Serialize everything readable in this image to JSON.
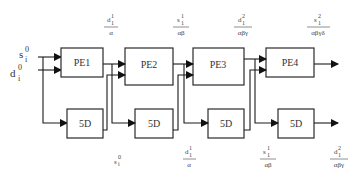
{
  "diagram": {
    "inputs": [
      {
        "base": "s",
        "sub": "i",
        "sup": "0"
      },
      {
        "base": "d",
        "sub": "i",
        "sup": "0"
      }
    ],
    "processing_elements": [
      {
        "label": "PE1"
      },
      {
        "label": "PE2"
      },
      {
        "label": "PE3"
      },
      {
        "label": "PE4"
      }
    ],
    "delay_blocks": [
      {
        "label": "5D"
      },
      {
        "label": "5D"
      },
      {
        "label": "5D"
      },
      {
        "label": "5D"
      }
    ],
    "top_labels": [
      {
        "num_base": "d",
        "num_sub": "1",
        "num_sup": "1",
        "den": "α"
      },
      {
        "num_base": "s",
        "num_sub": "1",
        "num_sup": "1",
        "den": "αβ"
      },
      {
        "num_base": "d",
        "num_sub": "1",
        "num_sup": "2",
        "den": "αβγ"
      },
      {
        "num_base": "s",
        "num_sub": "1",
        "num_sup": "2",
        "den": "αβγδ"
      }
    ],
    "bottom_labels": [
      {
        "plain_base": "s",
        "plain_sub": "i",
        "plain_sup": "0"
      },
      {
        "num_base": "d",
        "num_sub": "1",
        "num_sup": "1",
        "den": "α"
      },
      {
        "num_base": "s",
        "num_sub": "1",
        "num_sup": "1",
        "den": "αβ"
      },
      {
        "num_base": "d",
        "num_sub": "1",
        "num_sup": "2",
        "den": "αβγ"
      }
    ]
  }
}
